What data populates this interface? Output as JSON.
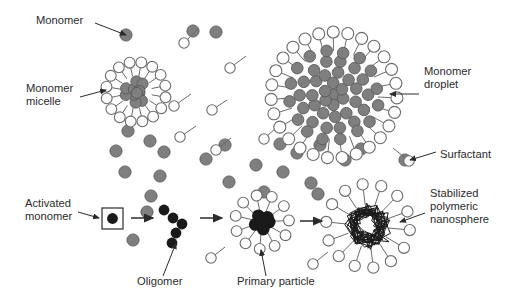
{
  "figure": {
    "background_color": "#ffffff",
    "width": 513,
    "height": 298
  },
  "palette": {
    "monomer_fill": "#7f7f7f",
    "monomer_stroke": "#5a5a5a",
    "activated_monomer_fill": "#1a1a1a",
    "surfactant_fill": "#ffffff",
    "surfactant_stroke": "#6b6b6b",
    "polymer_core": "#1a1a1a",
    "label_color": "#2b2b2b",
    "arrow_color": "#2b2b2b"
  },
  "labels": [
    {
      "id": "monomer",
      "text": "Monomer",
      "x": 36,
      "y": 24,
      "anchor": "start",
      "lines": [
        "Monomer"
      ]
    },
    {
      "id": "monomer-micelle",
      "text": "Monomer micelle",
      "x": 26,
      "y": 92,
      "anchor": "start",
      "lines": [
        "Monomer",
        "micelle"
      ]
    },
    {
      "id": "monomer-droplet",
      "text": "Monomer droplet",
      "x": 424,
      "y": 75,
      "anchor": "start",
      "lines": [
        "Monomer",
        "droplet"
      ]
    },
    {
      "id": "surfactant",
      "text": "Surfactant",
      "x": 440,
      "y": 158,
      "anchor": "start",
      "lines": [
        "Surfactant"
      ]
    },
    {
      "id": "activated-monomer",
      "text": "Activated monomer",
      "x": 25,
      "y": 207,
      "anchor": "start",
      "lines": [
        "Activated",
        "monomer"
      ]
    },
    {
      "id": "oligomer",
      "text": "Oligomer",
      "x": 137,
      "y": 285,
      "anchor": "start",
      "lines": [
        "Oligomer"
      ]
    },
    {
      "id": "primary-particle",
      "text": "Primary particle",
      "x": 237,
      "y": 285,
      "anchor": "start",
      "lines": [
        "Primary particle"
      ]
    },
    {
      "id": "stabilized-polymeric-nanosphere",
      "text": "Stabilized polymeric nanosphere",
      "x": 430,
      "y": 197,
      "anchor": "start",
      "lines": [
        "Stabilized",
        "polymeric",
        "nanosphere"
      ]
    }
  ],
  "leader_lines": [
    {
      "id": "monomer",
      "x1": 95,
      "y1": 23,
      "x2": 126,
      "y2": 35,
      "arrow": true
    },
    {
      "id": "monomer-micelle",
      "x1": 80,
      "y1": 97,
      "x2": 106,
      "y2": 90,
      "arrow": true
    },
    {
      "id": "monomer-droplet",
      "x1": 419,
      "y1": 94,
      "x2": 390,
      "y2": 94,
      "arrow": true
    },
    {
      "id": "surfactant",
      "x1": 436,
      "y1": 152,
      "x2": 410,
      "y2": 160,
      "arrow": true
    },
    {
      "id": "activated-monomer",
      "x1": 78,
      "y1": 212,
      "x2": 99,
      "y2": 218,
      "arrow": true
    },
    {
      "id": "oligomer",
      "x1": 163,
      "y1": 276,
      "x2": 176,
      "y2": 243,
      "arrow": true
    },
    {
      "id": "primary-particle",
      "x1": 266,
      "y1": 276,
      "x2": 261,
      "y2": 250,
      "arrow": true
    },
    {
      "id": "stabilized-polymeric-nanosphere",
      "x1": 425,
      "y1": 213,
      "x2": 400,
      "y2": 222,
      "arrow": true
    }
  ],
  "process_arrows": [
    {
      "id": "arrow-1",
      "x1": 131,
      "y1": 218,
      "x2": 153,
      "y2": 218
    },
    {
      "id": "arrow-2",
      "x1": 200,
      "y1": 218,
      "x2": 222,
      "y2": 218
    },
    {
      "id": "arrow-3",
      "x1": 300,
      "y1": 221,
      "x2": 322,
      "y2": 221
    }
  ],
  "activated_monomer_box": {
    "x": 102,
    "y": 208,
    "w": 21,
    "h": 21,
    "dot_r": 5.4
  },
  "free_monomers": [
    {
      "x": 126,
      "y": 35,
      "r": 6.1
    },
    {
      "x": 216,
      "y": 32,
      "r": 6.1
    },
    {
      "x": 128,
      "y": 131,
      "r": 6.1
    },
    {
      "x": 116,
      "y": 151,
      "r": 6.1
    },
    {
      "x": 150,
      "y": 141,
      "r": 6.1
    },
    {
      "x": 164,
      "y": 152,
      "r": 6.1
    },
    {
      "x": 125,
      "y": 172,
      "r": 6.1
    },
    {
      "x": 160,
      "y": 176,
      "r": 6.1
    },
    {
      "x": 206,
      "y": 159,
      "r": 6.1
    },
    {
      "x": 151,
      "y": 196,
      "r": 6.1
    },
    {
      "x": 147,
      "y": 212,
      "r": 6.1
    },
    {
      "x": 133,
      "y": 240,
      "r": 6.1
    },
    {
      "x": 229,
      "y": 182,
      "r": 6.1
    },
    {
      "x": 225,
      "y": 145,
      "r": 6.1
    },
    {
      "x": 280,
      "y": 144,
      "r": 6.1
    },
    {
      "x": 256,
      "y": 165,
      "r": 6.1
    },
    {
      "x": 283,
      "y": 172,
      "r": 6.1
    },
    {
      "x": 297,
      "y": 153,
      "r": 6.1
    },
    {
      "x": 311,
      "y": 183,
      "r": 6.1
    },
    {
      "x": 320,
      "y": 145,
      "r": 6.1
    },
    {
      "x": 345,
      "y": 160,
      "r": 6.1
    },
    {
      "x": 361,
      "y": 149,
      "r": 6.1
    },
    {
      "x": 405,
      "y": 160,
      "r": 6.1
    },
    {
      "x": 264,
      "y": 192,
      "r": 6.1
    },
    {
      "x": 193,
      "y": 31,
      "r": 6.1
    },
    {
      "x": 318,
      "y": 194,
      "r": 6.1
    }
  ],
  "free_surfactants": [
    {
      "cx": 184,
      "cy": 43,
      "tx": 199,
      "ty": 28
    },
    {
      "cx": 230,
      "cy": 68,
      "tx": 246,
      "ty": 56
    },
    {
      "cx": 174,
      "cy": 106,
      "tx": 191,
      "ty": 94
    },
    {
      "cx": 212,
      "cy": 110,
      "tx": 227,
      "ty": 100
    },
    {
      "cx": 216,
      "cy": 150,
      "tx": 231,
      "ty": 138
    },
    {
      "cx": 180,
      "cy": 137,
      "tx": 196,
      "ty": 126
    },
    {
      "cx": 409,
      "cy": 161,
      "tx": 393,
      "ty": 148
    },
    {
      "cx": 211,
      "cy": 258,
      "tx": 225,
      "ty": 247
    },
    {
      "cx": 313,
      "cy": 264,
      "tx": 328,
      "ty": 252
    },
    {
      "cx": 264,
      "cy": 139,
      "tx": 278,
      "ty": 126
    }
  ],
  "micelle": {
    "cx": 136,
    "cy": 92,
    "core_r": 17,
    "shell_r": 30,
    "core_count": 10,
    "shell_count": 16,
    "monomer_r": 5.6,
    "head_r": 5.4
  },
  "droplet": {
    "cx": 334,
    "cy": 95,
    "core_r": 46,
    "shell_r": 63,
    "core_count": 48,
    "shell_count": 27,
    "monomer_r": 5.8,
    "head_r": 6.0
  },
  "oligomer": {
    "beads": [
      {
        "x": 164,
        "y": 210,
        "r": 5.4
      },
      {
        "x": 173,
        "y": 218,
        "r": 5.4
      },
      {
        "x": 182,
        "y": 224,
        "r": 5.4
      },
      {
        "x": 176,
        "y": 233,
        "r": 5.4
      },
      {
        "x": 172,
        "y": 243,
        "r": 5.4
      }
    ]
  },
  "primary_particle": {
    "cx": 262,
    "cy": 222,
    "core_r": 13,
    "shell_r": 27,
    "shell_count": 11,
    "head_r": 5.4,
    "blob_count": 9
  },
  "nanosphere": {
    "cx": 368,
    "cy": 226,
    "core_r": 23,
    "shell_r": 42,
    "shell_count": 14,
    "head_r": 5.6,
    "scribble_loops": 22
  }
}
